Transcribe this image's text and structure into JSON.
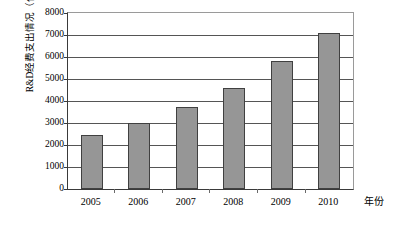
{
  "chart_data": {
    "type": "bar",
    "title": "",
    "xlabel": "年份",
    "ylabel": "R&D经费支出情况（亿元）",
    "categories": [
      "2005",
      "2006",
      "2007",
      "2008",
      "2009",
      "2010"
    ],
    "values": [
      2450,
      3000,
      3710,
      4610,
      5800,
      7100
    ],
    "series": [
      {
        "name": "R&D经费支出情况（亿元）",
        "values": [
          2450,
          3000,
          3710,
          4610,
          5800,
          7100
        ]
      }
    ],
    "ylim": [
      0,
      8000
    ],
    "ytick_step": 1000,
    "yticks": [
      "8000",
      "7000",
      "6000",
      "5000",
      "4000",
      "3000",
      "2000",
      "1000",
      "0"
    ],
    "ytick_values": [
      8000,
      7000,
      6000,
      5000,
      4000,
      3000,
      2000,
      1000,
      0
    ],
    "grid": true,
    "legend": "none",
    "legend_position": "none",
    "bar_color": "#969696",
    "bar_border_color": "#404040",
    "gridline_color": "#555555",
    "axis_color": "#3a3a3a",
    "background_color": "#ffffff"
  }
}
